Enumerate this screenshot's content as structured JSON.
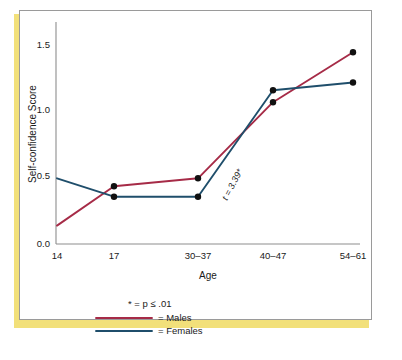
{
  "chart_data": {
    "type": "line",
    "title": "",
    "xlabel": "Age",
    "ylabel": "Self-confidence Score",
    "categories": [
      "14",
      "17",
      "30–37",
      "40–47",
      "54–61"
    ],
    "ytick_labels": [
      "0.0",
      "0.5",
      "1.0",
      "1.5"
    ],
    "yticks": [
      0.0,
      0.5,
      1.0,
      1.5
    ],
    "ylim": [
      0.0,
      1.6
    ],
    "grid": false,
    "legend_position": "below-axes",
    "series": [
      {
        "name": "Males",
        "color": "#a62b47",
        "values": [
          0.14,
          0.44,
          0.5,
          1.08,
          1.46
        ],
        "markers": [
          false,
          true,
          true,
          true,
          true
        ]
      },
      {
        "name": "Females",
        "color": "#1f4e6b",
        "values": [
          0.5,
          0.36,
          0.36,
          1.17,
          1.23
        ],
        "markers": [
          false,
          true,
          true,
          true,
          true
        ]
      }
    ],
    "annotations": [
      {
        "text": "t = 3.39*",
        "x_category": "30–37",
        "rotation_deg": -62
      }
    ]
  },
  "axis": {
    "y_label": "Self-confidence Score",
    "x_label": "Age",
    "y_tick_0": "0.0",
    "y_tick_1": "0.5",
    "y_tick_2": "1.0",
    "y_tick_3": "1.5",
    "x_tick_0": "14",
    "x_tick_1": "17",
    "x_tick_2": "30–37",
    "x_tick_3": "40–47",
    "x_tick_4": "54–61"
  },
  "annotation": {
    "t_value": "t = 3.39*"
  },
  "legend": {
    "significance_note": "* = p ≤ .01",
    "males_label": "= Males",
    "females_label": "= Females",
    "males_color": "#a62b47",
    "females_color": "#1f4e6b"
  },
  "theme": {
    "accent_band_color": "#f2e07a",
    "panel_border_color": "#9a9a9a",
    "axis_color": "#8d8d8d",
    "marker_color": "#111111",
    "background": "#ffffff"
  }
}
